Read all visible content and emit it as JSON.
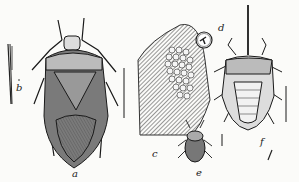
{
  "figure": {
    "colors": {
      "ink": "#1a1a1a",
      "paper": "#fbfbf9",
      "shade": "#555555"
    },
    "labels": {
      "a": "a",
      "b": "b",
      "c": "c",
      "d": "d",
      "e": "e",
      "f": "f"
    },
    "panels": [
      {
        "id": "a",
        "content": "adult bug, dorsal view"
      },
      {
        "id": "b",
        "content": "beak / mouthparts detail"
      },
      {
        "id": "c",
        "content": "egg mass on leaf"
      },
      {
        "id": "d",
        "content": "single egg, enlarged"
      },
      {
        "id": "e",
        "content": "young nymph"
      },
      {
        "id": "f",
        "content": "older nymph with beak extended"
      }
    ]
  }
}
